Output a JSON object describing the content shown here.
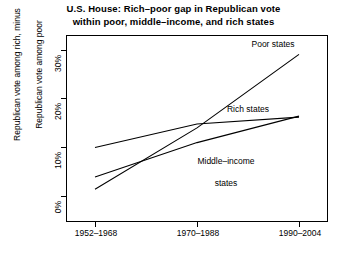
{
  "chart_data": {
    "type": "line",
    "title": "U.S. House:  Rich–poor gap in Republican vote\nwithin poor, middle–income, and rich states",
    "title_line1": "U.S. House:  Rich–poor gap in Republican vote",
    "title_line2": "within poor, middle–income, and rich states",
    "xlabel": "",
    "ylabel": "Republican vote among rich, minus\nRepublican vote among poor",
    "ylabel_line1": "Republican vote among rich, minus",
    "ylabel_line2": "Republican vote among poor",
    "categories": [
      "1952–1968",
      "1970–1988",
      "1990–2004"
    ],
    "x_tick_labels": [
      "1952–1968",
      "1970–1988",
      "1990–2004"
    ],
    "y_tick_labels": [
      "0%",
      "10%",
      "20%",
      "30%"
    ],
    "y_tick_values": [
      0,
      10,
      20,
      30
    ],
    "ylim": [
      -2,
      32
    ],
    "xlim": [
      0,
      2
    ],
    "grid": false,
    "legend": "inline-annotations",
    "legend_position": "inline",
    "series": [
      {
        "name": "Poor states",
        "label": "Poor states",
        "values": [
          1.5,
          14.0,
          29.0
        ],
        "color": "#000000"
      },
      {
        "name": "Rich states",
        "label": "Rich states",
        "values": [
          10.0,
          14.8,
          16.2
        ],
        "color": "#000000"
      },
      {
        "name": "Middle–income states",
        "label": "Middle–income\nstates",
        "label_line1": "Middle–income",
        "label_line2": "states",
        "values": [
          4.0,
          11.0,
          16.4
        ],
        "color": "#000000"
      }
    ],
    "annotations": [
      {
        "text": "Poor states",
        "series": "Poor states"
      },
      {
        "text": "Rich states",
        "series": "Rich states"
      },
      {
        "text": "Middle–income states",
        "series": "Middle–income states"
      }
    ],
    "axis_color": "#000000",
    "background": "#ffffff"
  }
}
